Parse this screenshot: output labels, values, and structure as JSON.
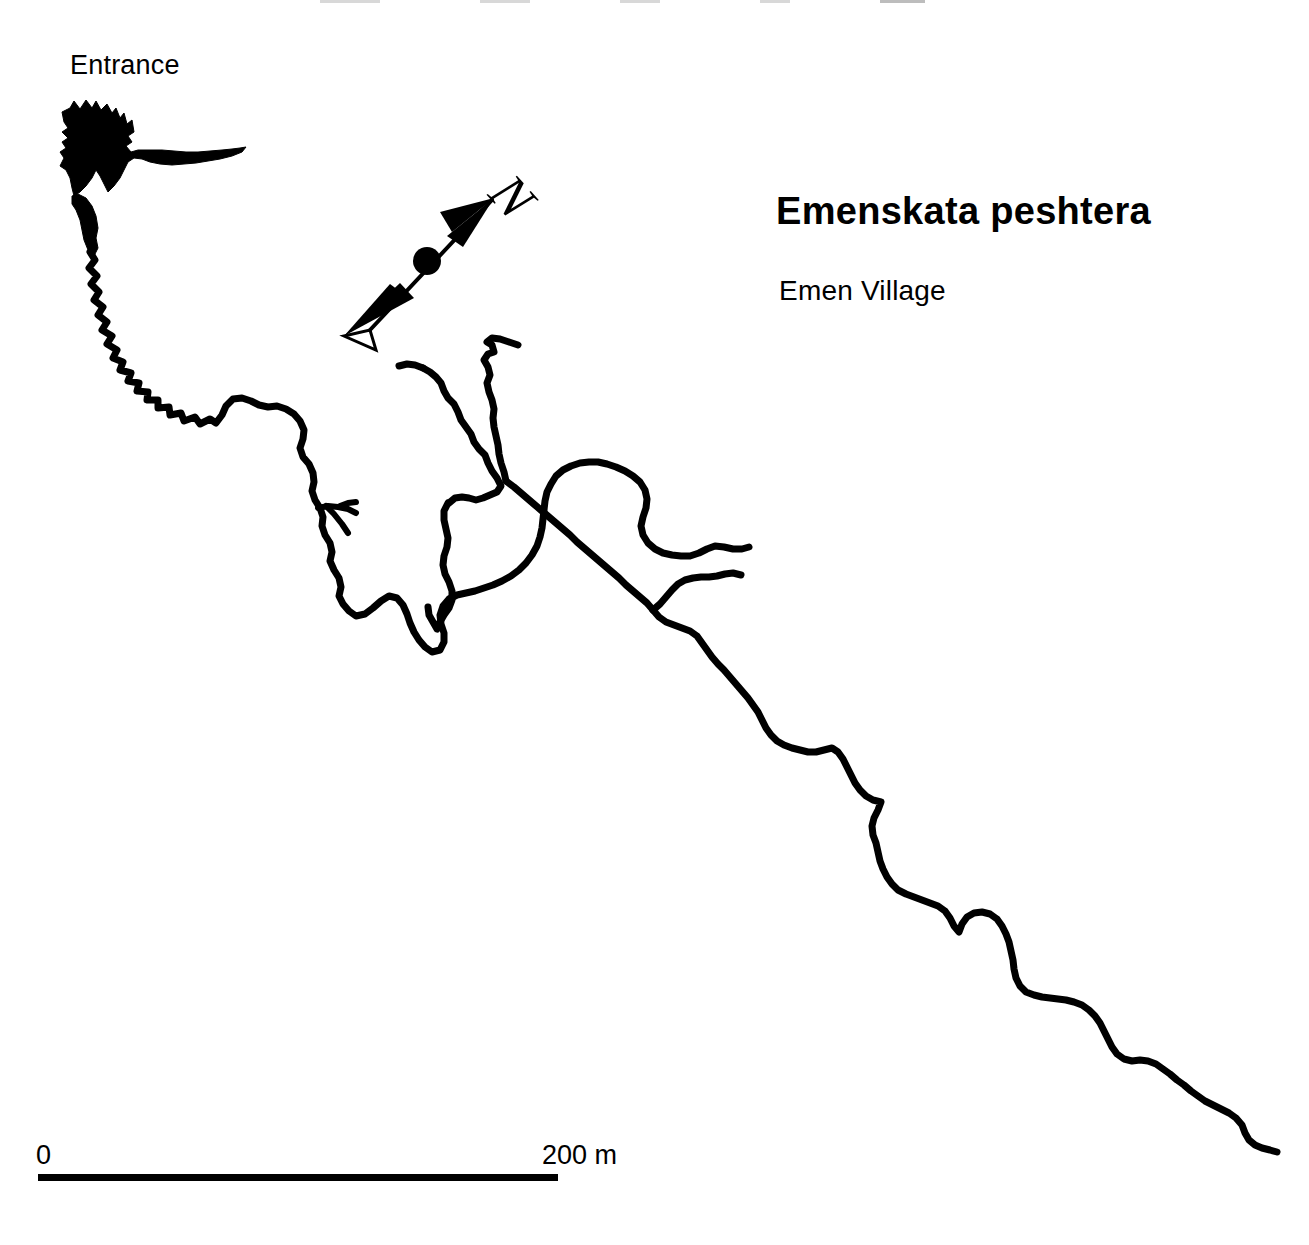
{
  "document": {
    "kind": "cave-survey-map",
    "background_color": "#ffffff",
    "ink_color": "#000000",
    "width": 1309,
    "height": 1245
  },
  "title_block": {
    "title": "Emenskata peshtera",
    "subtitle": "Emen Village"
  },
  "labels": {
    "entrance": "Entrance"
  },
  "scale_bar": {
    "start_label": "0",
    "end_label": "200 m",
    "length_px": 520,
    "represents_meters": 200,
    "units": "m"
  },
  "compass": {
    "icon": "north-arrow-icon",
    "letter": "N",
    "bearing_deg": 42,
    "description": "double-headed survey north arrow with centre dot and rotated N"
  },
  "survey": {
    "entrance_chamber": "irregular filled chamber at upper left",
    "passage_count": 9
  },
  "geometry": {
    "main_passage": "M 96 168 L 94 186 L 89 199 L 92 212 L 87 224 L 92 236 L 88 248 L 96 258 L 103 252 L 110 262 L 112 276 L 120 272 L 126 284 L 122 296 L 133 300 L 140 292 L 148 302 L 155 296 L 162 306 L 158 318 L 168 314 L 176 322 L 186 316 L 196 322 L 206 318 L 214 297 L 223 292 L 233 298 L 242 306 L 252 300 L 262 306 L 270 316 L 264 326 L 272 334 L 282 330 L 290 340 L 286 352 L 295 360 L 300 374 L 306 388 L 312 400 L 308 414 L 316 424 L 322 436 L 318 450 L 326 460 L 331 474 L 327 488 L 334 500 L 330 512 L 338 522 L 334 534 L 341 544 L 337 556 L 345 566 L 352 578 L 362 570 L 372 562 L 384 556 L 392 566 L 398 578 L 404 590 L 412 600 L 420 610 L 428 618 L 436 610 L 438 598 L 434 586 L 440 574 L 448 566 L 458 560 L 470 556 L 482 552 L 494 548 L 506 542 L 518 536 L 528 528 L 536 518 L 542 506 L 546 494 L 548 482 L 550 470 L 552 458 L 556 446 L 562 436 L 570 428 L 580 422 L 592 418 L 604 416 L 616 418 L 628 422 L 640 428 L 650 436 L 656 446 L 656 458 L 652 470 L 650 482 L 654 494 L 660 504 L 668 512 L 678 518 L 690 522 L 700 526 L 712 526 L 722 522 L 730 514 L 738 510 L 748 514",
    "lower_passage": "M 656 458 L 662 470 L 666 482 L 664 494 L 660 506 L 656 518 L 654 530 L 658 542 L 662 554 L 668 566 L 672 578 L 668 590 L 662 600 L 658 612 L 664 622 L 674 628 L 684 634 L 694 642 L 702 652 L 710 662 L 718 672 L 726 682 L 734 692 L 742 702 L 750 712 L 758 722 L 766 732 L 774 742 L 780 754 L 786 766 L 794 776 L 804 784 L 816 788 L 828 788 L 838 784 L 846 790 L 852 800 L 858 812 L 864 824 L 872 834 L 880 842 L 888 846 L 880 856 L 876 868 L 880 880 L 884 892 L 886 904 L 890 916 L 896 926 L 904 934 L 914 940 L 926 944 L 938 948 L 948 954 L 954 964 L 960 956 L 970 952 L 982 954 L 992 960 L 1000 970 L 1006 982 L 1010 994 L 1012 1006 L 1014 1018 L 1020 1028 L 1030 1034 L 1042 1038 L 1054 1040 L 1066 1042 L 1078 1044 L 1090 1048 L 1100 1056 L 1108 1066 L 1114 1078 L 1120 1088 L 1128 1096 L 1138 1102 L 1148 1100 L 1158 1104 L 1168 1112 L 1178 1120 L 1188 1128 L 1198 1136 L 1208 1142 L 1220 1148 L 1232 1154 L 1242 1162 L 1248 1174 L 1256 1182 L 1266 1188 L 1276 1194"
  }
}
